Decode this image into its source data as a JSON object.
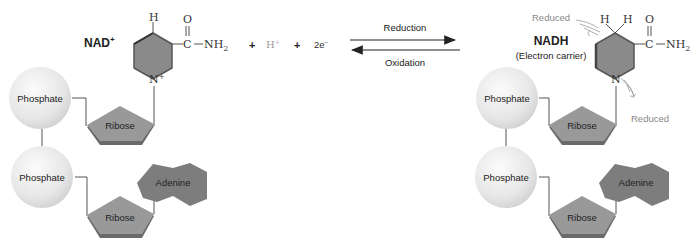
{
  "left": {
    "title": "NAD",
    "title_sup": "+",
    "ring": {
      "top_h": "H",
      "n_label": "N",
      "n_sup": "+",
      "carbonyl_o": "O",
      "carbon": "C",
      "amide": "NH",
      "amide_sub": "2"
    },
    "phosphate_top": "Phosphate",
    "phosphate_bottom": "Phosphate",
    "ribose_top": "Ribose",
    "ribose_bottom": "Ribose",
    "adenine": "Adenine"
  },
  "reaction": {
    "plus1": "+",
    "proton": "H",
    "proton_sup": "+",
    "plus2": "+",
    "electrons": "2e",
    "electrons_sup": "−",
    "forward_label": "Reduction",
    "reverse_label": "Oxidation"
  },
  "right": {
    "title": "NADH",
    "subtitle": "(Electron carrier)",
    "ring": {
      "h1": "H",
      "h2": "H",
      "n_label": "N",
      "carbonyl_o": "O",
      "carbon": "C",
      "amide": "NH",
      "amide_sub": "2"
    },
    "reduced_top": "Reduced",
    "reduced_bottom": "Reduced",
    "phosphate_top": "Phosphate",
    "phosphate_bottom": "Phosphate",
    "ribose_top": "Ribose",
    "ribose_bottom": "Ribose",
    "adenine": "Adenine"
  },
  "colors": {
    "ring_fill": "#8a8a8a",
    "ribose_fill": "#999999",
    "adenine_fill": "#7d7d7d",
    "phosphate_fill": "#eeeeee",
    "label_gray": "#888888"
  }
}
